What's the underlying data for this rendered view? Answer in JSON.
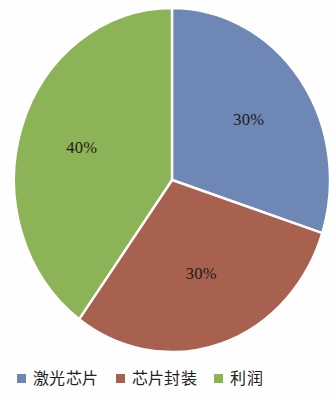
{
  "chart_data": {
    "type": "pie",
    "title": "",
    "subtitle": "",
    "xlabel": "",
    "ylabel": "",
    "legend_position": "bottom",
    "grid": false,
    "start_angle_deg": 0,
    "direction": "clockwise",
    "categories": [
      "激光芯片",
      "芯片封装",
      "利润"
    ],
    "values": [
      30,
      30,
      40
    ],
    "labels": [
      "30%",
      "30%",
      "40%"
    ],
    "colors": [
      "#6e87b5",
      "#a8604f",
      "#8db357"
    ],
    "slices": [
      {
        "name": "激光芯片",
        "value": 30,
        "label": "30%",
        "color": "#6e87b5",
        "start_deg": 0,
        "end_deg": 108
      },
      {
        "name": "芯片封装",
        "value": 30,
        "label": "30%",
        "color": "#a8604f",
        "start_deg": 108,
        "end_deg": 216
      },
      {
        "name": "利润",
        "value": 40,
        "label": "40%",
        "color": "#8db357",
        "start_deg": 216,
        "end_deg": 360
      }
    ]
  },
  "legend": {
    "items": [
      {
        "label": "激光芯片",
        "color": "#6e87b5"
      },
      {
        "label": "芯片封装",
        "color": "#a8604f"
      },
      {
        "label": "利润",
        "color": "#8db357"
      }
    ]
  },
  "theme": {
    "background": "#fefefe",
    "slice_border": "#ffffff",
    "label_color": "#1d1a17"
  }
}
